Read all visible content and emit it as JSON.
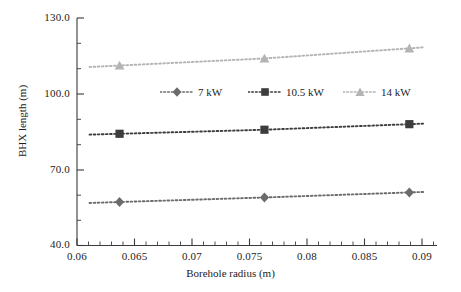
{
  "chart_data": {
    "type": "line",
    "title": "",
    "subtitle": "",
    "xlabel": "Borehole radius (m)",
    "ylabel": "BHX length (m)",
    "xlim": [
      0.06,
      0.09
    ],
    "ylim": [
      40.0,
      130.0
    ],
    "xticks": [
      "0.06",
      "0.065",
      "0.07",
      "0.075",
      "0.08",
      "0.085",
      "0.09"
    ],
    "xtick_values": [
      0.06,
      0.065,
      0.07,
      0.075,
      0.08,
      0.085,
      0.09
    ],
    "yticks": [
      "40.0",
      "70.0",
      "100.0",
      "130.0"
    ],
    "ytick_values": [
      40.0,
      70.0,
      100.0,
      130.0
    ],
    "minor_ticks": true,
    "grid": false,
    "legend_position": "center-inside",
    "x": [
      0.0637,
      0.0763,
      0.0889
    ],
    "series": [
      {
        "name": "7 kW",
        "marker": "diamond",
        "color": "#6b6b6b",
        "linestyle": "dotted",
        "values": [
          57.2,
          59.0,
          61.0
        ]
      },
      {
        "name": "10.5 kW",
        "marker": "square",
        "color": "#3d3d3d",
        "linestyle": "dotted",
        "values": [
          84.2,
          85.8,
          88.0
        ]
      },
      {
        "name": "14 kW",
        "marker": "triangle",
        "color": "#b4b4b4",
        "linestyle": "dotted",
        "values": [
          111.2,
          114.0,
          118.0
        ]
      }
    ]
  },
  "axes": {
    "x_title": "Borehole radius (m)",
    "y_title": "BHX length (m)",
    "x_tick_labels": [
      "0.06",
      "0.065",
      "0.07",
      "0.075",
      "0.08",
      "0.085",
      "0.09"
    ],
    "y_tick_labels": [
      "40.0",
      "70.0",
      "100.0",
      "130.0"
    ]
  },
  "legend": {
    "items": [
      {
        "label": "7 kW",
        "color": "#6b6b6b",
        "marker": "diamond"
      },
      {
        "label": "10.5 kW",
        "color": "#3d3d3d",
        "marker": "square"
      },
      {
        "label": "14 kW",
        "color": "#b4b4b4",
        "marker": "triangle"
      }
    ]
  },
  "colors": {
    "axis": "#3a3a3a",
    "background": "#ffffff",
    "series_7kw": "#6b6b6b",
    "series_105kw": "#3d3d3d",
    "series_14kw": "#b4b4b4"
  }
}
